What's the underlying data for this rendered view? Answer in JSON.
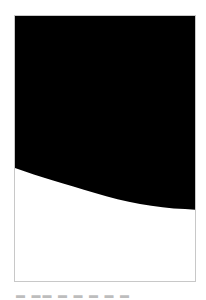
{
  "image": {
    "description": "Black shape with curved lower boundary inside a thin gray frame",
    "fill_color": "#000000",
    "background_color": "#ffffff",
    "frame_color": "#c8c8c8"
  },
  "caption": {
    "text": "▬ ▬▬ ▬ ▬ ▬ ▬ ▬"
  }
}
